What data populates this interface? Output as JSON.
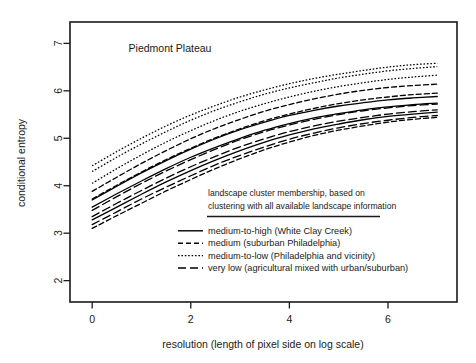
{
  "panel": {
    "title": "Piedmont Plateau"
  },
  "axes": {
    "ylabel": "conditional entropy",
    "xlabel": "resolution (length of pixel side on log scale)",
    "xticks": [
      "0",
      "2",
      "4",
      "6"
    ],
    "yticks": [
      "2",
      "3",
      "4",
      "5",
      "6",
      "7"
    ]
  },
  "legend": {
    "header_line1": "landscape cluster membership, based on",
    "header_line2": "clustering with all available landscape information",
    "items": [
      {
        "label": "medium-to-high (White Clay Creek)",
        "style": "solid",
        "dash": "none"
      },
      {
        "label": "medium (suburban Philadelphia)",
        "style": "dashed",
        "dash": "5,3"
      },
      {
        "label": "medium-to-low (Philadelphia and vicinity)",
        "style": "dotted",
        "dash": "1.6,1.8"
      },
      {
        "label": "very low (agricultural mixed with urban/suburban)",
        "style": "longdash",
        "dash": "8,4"
      }
    ]
  },
  "style": {
    "ink": "#000000",
    "frame": "#1a1a1a",
    "background": "#ffffff"
  },
  "chart_data": {
    "type": "line",
    "title": "Piedmont Plateau",
    "xlabel": "resolution (length of pixel side on log scale)",
    "ylabel": "conditional entropy",
    "xlim": [
      -0.45,
      7.4
    ],
    "ylim": [
      1.55,
      7.45
    ],
    "xticks": [
      0,
      2,
      4,
      6
    ],
    "yticks": [
      2,
      3,
      4,
      5,
      6,
      7
    ],
    "grid": false,
    "legend_position": "inside-lower-center",
    "x": [
      0,
      0.5,
      1,
      1.5,
      2,
      2.5,
      3,
      3.5,
      4,
      4.5,
      5,
      5.5,
      6,
      6.5,
      7
    ],
    "series": [
      {
        "name": "medium-to-low (Philadelphia and vicinity) a",
        "group": "medium-to-low",
        "style": "dotted",
        "values": [
          4.42,
          4.72,
          5.0,
          5.26,
          5.49,
          5.69,
          5.87,
          6.02,
          6.15,
          6.26,
          6.35,
          6.43,
          6.5,
          6.55,
          6.58
        ]
      },
      {
        "name": "medium-to-low (Philadelphia and vicinity) b",
        "group": "medium-to-low",
        "style": "dotted",
        "values": [
          4.3,
          4.6,
          4.88,
          5.14,
          5.38,
          5.59,
          5.77,
          5.93,
          6.06,
          6.17,
          6.27,
          6.35,
          6.42,
          6.47,
          6.51
        ]
      },
      {
        "name": "medium-to-low (Philadelphia and vicinity) c",
        "group": "medium-to-low",
        "style": "dotted",
        "values": [
          4.05,
          4.36,
          4.65,
          4.92,
          5.16,
          5.38,
          5.57,
          5.73,
          5.87,
          5.99,
          6.09,
          6.17,
          6.24,
          6.29,
          6.33
        ]
      },
      {
        "name": "medium (suburban Philadelphia) a",
        "group": "medium",
        "style": "dashed",
        "values": [
          3.88,
          4.18,
          4.47,
          4.74,
          4.99,
          5.21,
          5.4,
          5.57,
          5.71,
          5.83,
          5.93,
          6.01,
          6.07,
          6.11,
          6.14
        ]
      },
      {
        "name": "medium (suburban Philadelphia) b",
        "group": "medium",
        "style": "dashed",
        "values": [
          3.72,
          4.01,
          4.29,
          4.55,
          4.79,
          5.01,
          5.2,
          5.37,
          5.51,
          5.63,
          5.73,
          5.81,
          5.87,
          5.92,
          5.95
        ]
      },
      {
        "name": "medium-to-high (White Clay Creek) a",
        "group": "medium-to-high",
        "style": "solid",
        "values": [
          3.7,
          3.99,
          4.27,
          4.53,
          4.77,
          4.99,
          5.18,
          5.34,
          5.48,
          5.59,
          5.68,
          5.75,
          5.81,
          5.85,
          5.88
        ]
      },
      {
        "name": "medium-to-high (White Clay Creek) b",
        "group": "medium-to-high",
        "style": "solid",
        "values": [
          3.55,
          3.83,
          4.1,
          4.36,
          4.6,
          4.81,
          5.0,
          5.17,
          5.31,
          5.43,
          5.52,
          5.6,
          5.66,
          5.71,
          5.74
        ]
      },
      {
        "name": "very low (agricultural mixed with urban/suburban) a",
        "group": "very-low",
        "style": "longdash",
        "values": [
          3.48,
          3.77,
          4.05,
          4.31,
          4.55,
          4.77,
          4.97,
          5.14,
          5.28,
          5.4,
          5.5,
          5.58,
          5.64,
          5.69,
          5.72
        ]
      },
      {
        "name": "very low (agricultural mixed with urban/suburban) b",
        "group": "very-low",
        "style": "longdash",
        "values": [
          3.35,
          3.63,
          3.9,
          4.16,
          4.4,
          4.62,
          4.82,
          4.99,
          5.14,
          5.26,
          5.36,
          5.44,
          5.51,
          5.56,
          5.6
        ]
      },
      {
        "name": "medium-to-high (White Clay Creek) c",
        "group": "medium-to-high",
        "style": "solid",
        "values": [
          3.28,
          3.55,
          3.82,
          4.08,
          4.32,
          4.54,
          4.74,
          4.92,
          5.07,
          5.2,
          5.3,
          5.39,
          5.46,
          5.51,
          5.55
        ]
      },
      {
        "name": "very low (agricultural mixed with urban/suburban) c",
        "group": "very-low",
        "style": "longdash",
        "values": [
          3.18,
          3.45,
          3.72,
          3.97,
          4.21,
          4.44,
          4.64,
          4.82,
          4.98,
          5.11,
          5.22,
          5.31,
          5.38,
          5.44,
          5.48
        ]
      },
      {
        "name": "medium (suburban Philadelphia) c",
        "group": "medium",
        "style": "dashed",
        "values": [
          3.1,
          3.37,
          3.63,
          3.89,
          4.13,
          4.36,
          4.57,
          4.76,
          4.92,
          5.06,
          5.17,
          5.26,
          5.34,
          5.4,
          5.44
        ]
      }
    ]
  }
}
